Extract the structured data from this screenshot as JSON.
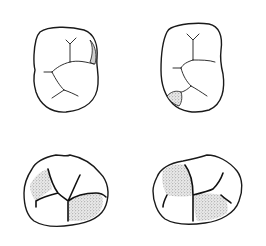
{
  "diagram": {
    "title": "",
    "panels": [
      {
        "id": "top-left",
        "view": "occlusal outline with grooves",
        "highlight": "shaded area at distal marginal ridge (upper right)",
        "label": ""
      },
      {
        "id": "top-right",
        "view": "occlusal outline with grooves",
        "highlight": "shaded area at lower left corner",
        "label": ""
      },
      {
        "id": "bottom-left",
        "view": "occlusal outline with grooves",
        "highlight": "stippled cusp regions (upper left and lower right)",
        "label": ""
      },
      {
        "id": "bottom-right",
        "view": "occlusal outline with grooves",
        "highlight": "stippled cusp regions (upper left and lower right)",
        "label": ""
      }
    ],
    "colors": {
      "line": "#1a1a1a",
      "stipple": "#9a9a9a",
      "background": "#ffffff"
    }
  }
}
